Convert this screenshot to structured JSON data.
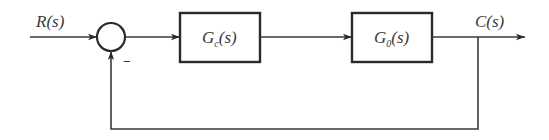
{
  "diagram": {
    "type": "block-diagram",
    "input": {
      "label": "R(s)"
    },
    "output": {
      "label": "C(s)"
    },
    "summing_junction": {
      "feedback_sign": "−"
    },
    "blocks": [
      {
        "id": "controller",
        "label_main": "G",
        "label_sub": "c",
        "label_arg": "(s)"
      },
      {
        "id": "plant",
        "label_main": "G",
        "label_sub": "0",
        "label_arg": "(s)"
      }
    ],
    "colors": {
      "stroke": "#2a2a2a",
      "text": "#3a3a3a",
      "background": "#ffffff"
    }
  }
}
